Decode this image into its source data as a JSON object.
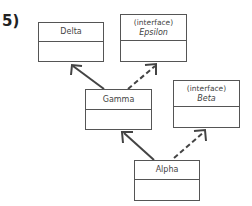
{
  "diagram": {
    "label": "5)",
    "classes": [
      {
        "id": "delta",
        "name": "Delta",
        "stereotype": ""
      },
      {
        "id": "epsilon",
        "name": "Epsilon",
        "stereotype": "(interface)"
      },
      {
        "id": "gamma",
        "name": "Gamma",
        "stereotype": ""
      },
      {
        "id": "beta",
        "name": "Beta",
        "stereotype": "(interface)"
      },
      {
        "id": "alpha",
        "name": "Alpha",
        "stereotype": ""
      }
    ],
    "relations": [
      {
        "from": "Gamma",
        "to": "Delta",
        "type": "extends",
        "line": "solid"
      },
      {
        "from": "Gamma",
        "to": "Epsilon",
        "type": "implements",
        "line": "dashed"
      },
      {
        "from": "Alpha",
        "to": "Gamma",
        "type": "extends",
        "line": "solid"
      },
      {
        "from": "Alpha",
        "to": "Beta",
        "type": "implements",
        "line": "dashed"
      }
    ],
    "colors": {
      "stroke": "#555555",
      "text": "#444444",
      "background": "#ffffff"
    }
  }
}
